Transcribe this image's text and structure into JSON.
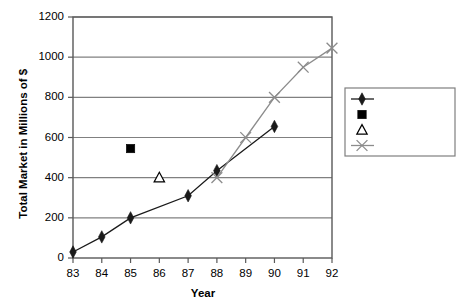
{
  "chart_data": {
    "type": "line",
    "title": "",
    "xlabel": "Year",
    "ylabel": "Total Market in Millions of $",
    "ylabel_parts": {
      "main": "Total Market in Millions of ",
      "bold_suffix": "$"
    },
    "categories": [
      "83",
      "84",
      "85",
      "86",
      "87",
      "88",
      "89",
      "90",
      "91",
      "92"
    ],
    "ylim": [
      0,
      1200
    ],
    "ytick_labels": [
      "0",
      "200",
      "400",
      "600",
      "800",
      "1000",
      "1200"
    ],
    "ytick_values": [
      0,
      200,
      400,
      600,
      800,
      1000,
      1200
    ],
    "grid": {
      "horizontal": true,
      "vertical": false
    },
    "legend_position": "right",
    "series": [
      {
        "name": "Market",
        "marker": "diamond",
        "color": "#1a1a1a",
        "line": true,
        "x": [
          "83",
          "84",
          "85",
          "87",
          "88",
          "90"
        ],
        "values": [
          30,
          105,
          200,
          310,
          435,
          655
        ]
      },
      {
        "name": "Prediction (81)",
        "marker": "square",
        "color": "#000000",
        "line": false,
        "x": [
          "85"
        ],
        "values": [
          545
        ]
      },
      {
        "name": "Prediction (86)",
        "marker": "triangle-open",
        "color": "#000000",
        "line": false,
        "x": [
          "86"
        ],
        "values": [
          400
        ]
      },
      {
        "name": "Prediction (88)",
        "marker": "x",
        "color": "#8c8c8c",
        "line": true,
        "x": [
          "88",
          "89",
          "90",
          "91",
          "92"
        ],
        "values": [
          400,
          600,
          800,
          950,
          1045
        ]
      }
    ]
  },
  "legend": {
    "entries": [
      {
        "label": "Market"
      },
      {
        "label": "Prediction (81)"
      },
      {
        "label": "Prediction (86)"
      },
      {
        "label": "Prediction (88)"
      }
    ]
  }
}
